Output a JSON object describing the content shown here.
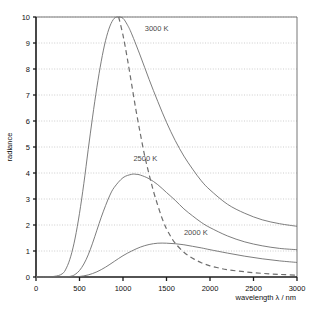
{
  "chart_data": {
    "type": "line",
    "title": "",
    "xlabel": "wavelength λ / nm",
    "ylabel": "radiance",
    "xlim": [
      0,
      3000
    ],
    "ylim": [
      0,
      10
    ],
    "xticks": [
      0,
      500,
      1000,
      1500,
      2000,
      2500,
      3000
    ],
    "xtick_labels": [
      "0",
      "500",
      "1000",
      "1500",
      "2000",
      "2500",
      "3000"
    ],
    "yticks": [
      0,
      1,
      2,
      3,
      4,
      5,
      6,
      7,
      8,
      9,
      10
    ],
    "ytick_labels": [
      "0",
      "1",
      "2",
      "3",
      "4",
      "5",
      "6",
      "7",
      "8",
      "9",
      "10"
    ],
    "grid": "horizontal-dotted",
    "legend_position": "inline-annotations",
    "line_color": "#6e6e6e",
    "grid_color": "#b8b8b8",
    "axis_color": "#1a1a1a",
    "series": [
      {
        "name": "3000 K",
        "label": "3000 K",
        "style": "solid",
        "label_x": 1250,
        "label_y": 9.45,
        "x": [
          0,
          200,
          300,
          350,
          400,
          450,
          500,
          550,
          600,
          650,
          700,
          750,
          800,
          850,
          900,
          950,
          1000,
          1050,
          1100,
          1200,
          1300,
          1400,
          1500,
          1600,
          1700,
          1800,
          1900,
          2000,
          2200,
          2400,
          2600,
          2800,
          3000
        ],
        "values": [
          0,
          0.02,
          0.12,
          0.35,
          0.8,
          1.5,
          2.45,
          3.6,
          4.9,
          6.15,
          7.3,
          8.3,
          9.1,
          9.65,
          9.95,
          10.0,
          9.95,
          9.7,
          9.35,
          8.5,
          7.6,
          6.75,
          5.95,
          5.25,
          4.65,
          4.15,
          3.7,
          3.35,
          2.8,
          2.45,
          2.2,
          2.05,
          1.95
        ]
      },
      {
        "name": "2500 K",
        "label": "2500 K",
        "style": "solid",
        "label_x": 1120,
        "label_y": 4.45,
        "x": [
          0,
          300,
          400,
          450,
          500,
          550,
          600,
          650,
          700,
          750,
          800,
          850,
          900,
          1000,
          1100,
          1150,
          1200,
          1300,
          1400,
          1500,
          1600,
          1700,
          1800,
          1900,
          2000,
          2200,
          2400,
          2600,
          2800,
          3000
        ],
        "values": [
          0,
          0.0,
          0.03,
          0.1,
          0.25,
          0.5,
          0.85,
          1.3,
          1.8,
          2.3,
          2.75,
          3.15,
          3.45,
          3.82,
          3.95,
          3.95,
          3.92,
          3.78,
          3.55,
          3.25,
          2.95,
          2.62,
          2.35,
          2.1,
          1.9,
          1.58,
          1.35,
          1.2,
          1.1,
          1.05
        ]
      },
      {
        "name": "2000 K",
        "label": "2000 K",
        "style": "solid",
        "label_x": 1700,
        "label_y": 1.62,
        "x": [
          0,
          400,
          500,
          600,
          700,
          800,
          900,
          1000,
          1100,
          1200,
          1300,
          1400,
          1500,
          1600,
          1700,
          1800,
          1900,
          2000,
          2200,
          2400,
          2600,
          2800,
          3000
        ],
        "values": [
          0,
          0.0,
          0.02,
          0.08,
          0.2,
          0.38,
          0.6,
          0.82,
          1.0,
          1.15,
          1.25,
          1.3,
          1.3,
          1.28,
          1.24,
          1.18,
          1.12,
          1.05,
          0.92,
          0.8,
          0.7,
          0.62,
          0.56
        ]
      },
      {
        "name": "wien-displacement",
        "label": "",
        "style": "dashed",
        "x": [
          950,
          1000,
          1050,
          1100,
          1150,
          1200,
          1250,
          1300,
          1350,
          1400,
          1450,
          1500,
          1550,
          1600,
          1700,
          1800,
          1900,
          2000,
          2100,
          2200,
          2400,
          2600,
          2800,
          3000
        ],
        "values": [
          10.0,
          9.3,
          8.4,
          7.4,
          6.4,
          5.5,
          4.65,
          3.95,
          3.3,
          2.75,
          2.25,
          1.85,
          1.55,
          1.3,
          0.95,
          0.72,
          0.55,
          0.43,
          0.35,
          0.28,
          0.2,
          0.14,
          0.1,
          0.07
        ]
      }
    ]
  },
  "axes": {
    "xlabel": "wavelength λ / nm",
    "ylabel": "radiance"
  }
}
